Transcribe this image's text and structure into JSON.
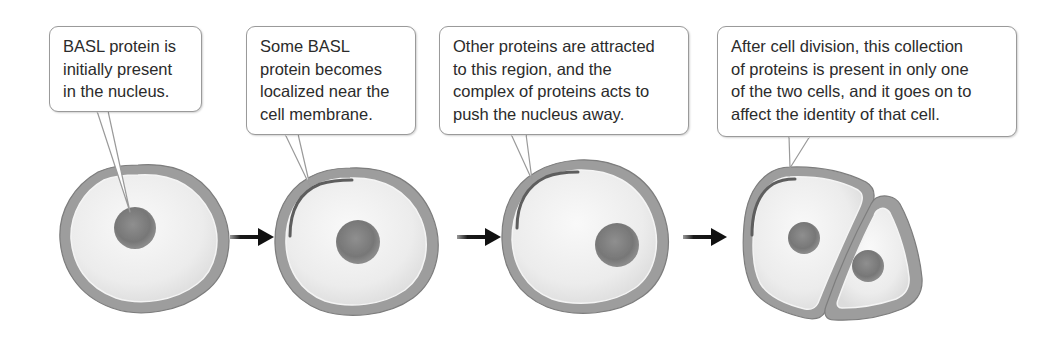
{
  "figure": {
    "steps": [
      {
        "index": 1,
        "callout": "BASL protein is\ninitially present\nin the nucleus.",
        "state": "BASL in nucleus; nucleus centered"
      },
      {
        "index": 2,
        "callout": "Some BASL\nprotein becomes\nlocalized near the\ncell membrane.",
        "state": "BASL crescent at upper-left membrane; nucleus centered"
      },
      {
        "index": 3,
        "callout": "Other proteins are attracted\nto this region, and the\ncomplex of proteins acts to\npush the nucleus away.",
        "state": "BASL crescent at upper-left membrane; nucleus displaced to lower-right"
      },
      {
        "index": 4,
        "callout": "After cell division, this collection\nof proteins is present in only one\nof the two cells, and it goes on to\naffect the identity of that cell.",
        "state": "Two daughter cells; crescent only in the larger left cell"
      }
    ],
    "arrows": [
      {
        "from": 1,
        "to": 2,
        "icon": "right-arrow-icon"
      },
      {
        "from": 2,
        "to": 3,
        "icon": "right-arrow-icon"
      },
      {
        "from": 3,
        "to": 4,
        "icon": "right-arrow-icon"
      }
    ],
    "colors": {
      "cell_wall": "#9d9d9d",
      "cell_wall_edge": "#7d7d7d",
      "membrane_line": "#f4f4f4",
      "cytoplasm": "#ececec",
      "nucleus": "#7b7b7b",
      "basl_crescent": "#5e5e5e",
      "callout_border": "#9a9a9a",
      "text": "#2b2b2b",
      "arrow": "#1a1a1a"
    }
  }
}
